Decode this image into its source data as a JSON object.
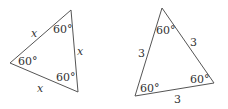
{
  "diagram": {
    "left_triangle": {
      "side_labels": [
        "x",
        "x",
        "x"
      ],
      "angle_labels": [
        "60°",
        "60°",
        "60°"
      ]
    },
    "right_triangle": {
      "side_labels": [
        "3",
        "3",
        "3"
      ],
      "angle_labels": [
        "60°",
        "60°",
        "60°"
      ]
    },
    "stroke_color": "#555555"
  }
}
